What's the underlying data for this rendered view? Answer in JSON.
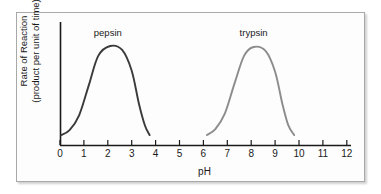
{
  "figure": {
    "caption_x": "pH",
    "ylabel_line1": "Rate of Reaction",
    "ylabel_line2": "(product per unit of time)"
  },
  "chart_data": {
    "type": "line",
    "title": "",
    "xlabel": "pH",
    "ylabel": "Rate of Reaction (product per unit of time)",
    "xlim": [
      0,
      12
    ],
    "ylim": [
      0,
      1
    ],
    "grid": false,
    "legend": "inline-annotations",
    "xticks": [
      0,
      1,
      2,
      3,
      4,
      5,
      6,
      7,
      8,
      9,
      10,
      11,
      12
    ],
    "xtick_labels": [
      "0",
      "1",
      "2",
      "3",
      "4",
      "5",
      "6",
      "7",
      "8",
      "9",
      "10",
      "11",
      "12"
    ],
    "yticks": [],
    "ytick_labels": [],
    "series": [
      {
        "name": "pepsin",
        "label": "pepsin",
        "color": "#3a3a3a",
        "x_range": [
          0.05,
          3.75
        ],
        "peak_x": 2.1,
        "peak_y": 1.0,
        "x": [
          0.05,
          0.4,
          0.8,
          1.2,
          1.6,
          2.1,
          2.6,
          3.0,
          3.3,
          3.55,
          3.75
        ],
        "y": [
          0.1,
          0.15,
          0.3,
          0.6,
          0.9,
          1.0,
          0.96,
          0.75,
          0.42,
          0.2,
          0.1
        ]
      },
      {
        "name": "trypsin",
        "label": "trypsin",
        "color": "#8c8c8c",
        "x_range": [
          6.15,
          9.8
        ],
        "peak_x": 8.1,
        "peak_y": 0.99,
        "x": [
          6.15,
          6.5,
          6.9,
          7.3,
          7.7,
          8.1,
          8.6,
          9.0,
          9.3,
          9.55,
          9.8
        ],
        "y": [
          0.1,
          0.16,
          0.32,
          0.62,
          0.9,
          0.99,
          0.95,
          0.74,
          0.42,
          0.2,
          0.1
        ]
      }
    ],
    "annotations": [
      {
        "text": "pepsin",
        "x": 2.0,
        "y": 1.13
      },
      {
        "text": "trypsin",
        "x": 8.1,
        "y": 1.13
      }
    ],
    "axes": {
      "x_axis_color": "#1a1a1a",
      "y_axis_color": "#1a1a1a",
      "x_axis_pixel_y": 145,
      "y_axis_pixel_x": 60,
      "x_pixel_start": 60,
      "x_pixel_per_unit": 23.9
    }
  }
}
